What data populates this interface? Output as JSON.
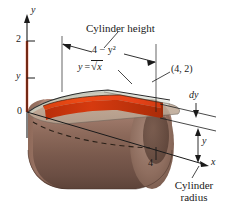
{
  "figure": {
    "title_hidden": "",
    "axes": {
      "y_axis_label": "y",
      "x_axis_label": "x",
      "origin_label": "0",
      "y_tick_2": "2",
      "y_tick_y": "y",
      "x_tick_4": "4"
    },
    "annotations": {
      "cylinder_height": "Cylinder height",
      "shell_width": "4 − y²",
      "curve_equation_lhs": "y",
      "curve_equation_eq": "=",
      "curve_equation_rhs": "x",
      "curve_equation_full": "y = √x",
      "point_label": "(4, 2)",
      "dy_label": "dy",
      "y_dim_label": "y",
      "cylinder_radius_line1": "Cylinder",
      "cylinder_radius_line2": "radius"
    },
    "colors": {
      "background": "#ffffff",
      "ink": "#1a1a1a",
      "shell_red": "#e23c10",
      "shell_red_dark": "#b8300c",
      "cylinder_light": "#c9a храни",
      "cylinder_mid": "#9d7a68",
      "cylinder_dark": "#5e4236",
      "surface_tan": "#c3a48f",
      "surface_green_tint": "#b9c6b4"
    }
  }
}
